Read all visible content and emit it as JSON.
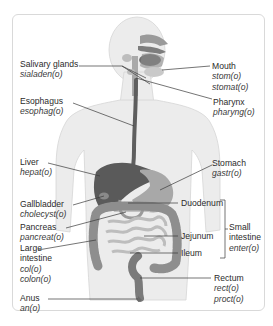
{
  "diagram": {
    "labels": {
      "salivary_glands": {
        "name": "Salivary glands",
        "roots": [
          "sialaden(o)"
        ]
      },
      "mouth": {
        "name": "Mouth",
        "roots": [
          "stom(o)",
          "stomat(o)"
        ]
      },
      "esophagus": {
        "name": "Esophagus",
        "roots": [
          "esophag(o)"
        ]
      },
      "pharynx": {
        "name": "Pharynx",
        "roots": [
          "pharyng(o)"
        ]
      },
      "liver": {
        "name": "Liver",
        "roots": [
          "hepat(o)"
        ]
      },
      "stomach": {
        "name": "Stomach",
        "roots": [
          "gastr(o)"
        ]
      },
      "gallbladder": {
        "name": "Gallbladder",
        "roots": [
          "cholecyst(o)"
        ]
      },
      "duodenum": {
        "name": "Duodenum",
        "roots": []
      },
      "pancreas": {
        "name": "Pancreas",
        "roots": [
          "pancreat(o)"
        ]
      },
      "jejunum": {
        "name": "Jejunum",
        "roots": []
      },
      "small_intestine": {
        "name_line1": "Small",
        "name_line2": "intestine",
        "roots": [
          "enter(o)"
        ]
      },
      "large_intestine": {
        "name_line1": "Large",
        "name_line2": "intestine",
        "roots": [
          "col(o)",
          "colon(o)"
        ]
      },
      "ileum": {
        "name": "Ileum",
        "roots": []
      },
      "rectum": {
        "name": "Rectum",
        "roots": [
          "rect(o)",
          "proct(o)"
        ]
      },
      "anus": {
        "name": "Anus",
        "roots": [
          "an(o)"
        ]
      }
    },
    "colors": {
      "body": "#ececec",
      "body_outline": "#d2d2d2",
      "organ_dark": "#555555",
      "organ_mid": "#8a8a8a",
      "organ_light": "#b5b5b5",
      "leader_line": "#3a3a3a",
      "frame_border": "#d9d9d9"
    }
  }
}
